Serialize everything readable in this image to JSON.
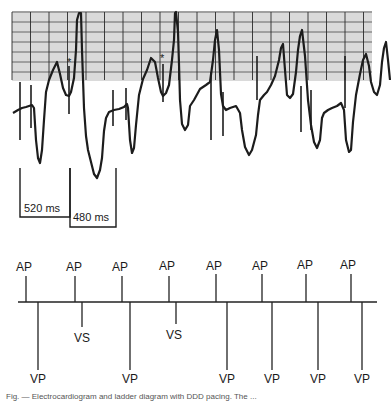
{
  "ecg_strip": {
    "grid": {
      "left": 12,
      "top": 12,
      "right": 186,
      "bottom": 80,
      "minor_color": "#6a6a6a",
      "major_color": "#2a2a2a"
    },
    "asterisk_marks": [
      {
        "x": 69,
        "y": 62,
        "text": "*"
      },
      {
        "x": 163,
        "y": 58,
        "text": "*"
      }
    ],
    "intervals": [
      {
        "label": "520 ms",
        "x1": 20,
        "x2": 70,
        "y": 97
      },
      {
        "label": "480 ms",
        "x1": 70,
        "x2": 116,
        "y": 107
      }
    ]
  },
  "ladder_diagram": {
    "baseline_y": 302,
    "baseline_x1": 18,
    "baseline_x2": 377,
    "atrial_events": [
      {
        "label": "AP",
        "x": 26
      },
      {
        "label": "AP",
        "x": 75
      },
      {
        "label": "AP",
        "x": 122
      },
      {
        "label": "AP",
        "x": 169
      },
      {
        "label": "AP",
        "x": 216
      },
      {
        "label": "AP",
        "x": 262
      },
      {
        "label": "AP",
        "x": 306
      },
      {
        "label": "AP",
        "x": 351
      }
    ],
    "ventricular_events": [
      {
        "label": "VP",
        "x": 38,
        "type": "paced"
      },
      {
        "label": "VS",
        "x": 82,
        "type": "sensed"
      },
      {
        "label": "VP",
        "x": 130,
        "type": "paced"
      },
      {
        "label": "VS",
        "x": 176,
        "type": "sensed"
      },
      {
        "label": "VP",
        "x": 227,
        "type": "paced"
      },
      {
        "label": "VP",
        "x": 272,
        "type": "paced"
      },
      {
        "label": "VP",
        "x": 318,
        "type": "paced"
      },
      {
        "label": "VP",
        "x": 362,
        "type": "paced"
      }
    ]
  },
  "caption": {
    "text": "Fig. — Electrocardiogram and ladder diagram with DDD pacing. The ..."
  }
}
